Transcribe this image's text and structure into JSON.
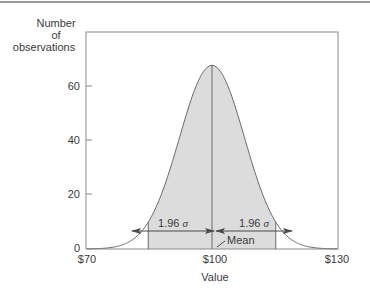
{
  "chart_data": {
    "type": "area",
    "title": "",
    "xlabel": "Value",
    "ylabel": "Number of observations",
    "ylabel_lines": [
      "Number",
      "of",
      "observations"
    ],
    "x_ticks": [
      "$70",
      "$100",
      "$130"
    ],
    "x_tick_values": [
      70,
      100,
      130
    ],
    "y_ticks": [
      "0",
      "20",
      "40",
      "60"
    ],
    "y_tick_values": [
      0,
      20,
      40,
      60
    ],
    "xlim": [
      70,
      130
    ],
    "ylim": [
      0,
      80
    ],
    "grid": false,
    "distribution": "normal",
    "mean": 100,
    "peak_observations": 68,
    "shaded_interval": [
      84.7,
      115.3
    ],
    "annotations": [
      {
        "text": "1.96 σ",
        "from": 84.7,
        "to": 100,
        "label_parts": [
          "1.96",
          "σ"
        ]
      },
      {
        "text": "1.96 σ",
        "from": 100,
        "to": 115.3,
        "label_parts": [
          "1.96",
          "σ"
        ]
      },
      {
        "text": "Mean",
        "x": 100
      }
    ],
    "x": [
      70,
      75,
      80,
      85,
      90,
      95,
      100,
      105,
      110,
      115,
      120,
      125,
      130
    ],
    "values": [
      0.3,
      1.5,
      5.6,
      15.3,
      30.2,
      50.3,
      68,
      50.3,
      30.2,
      15.3,
      5.6,
      1.5,
      0.3
    ]
  },
  "labels": {
    "ylabel_1": "Number",
    "ylabel_2": "of",
    "ylabel_3": "observations",
    "xlabel": "Value",
    "y60": "60",
    "y40": "40",
    "y20": "20",
    "y0": "0",
    "x70": "$70",
    "x100": "$100",
    "x130": "$130",
    "left_sigma_num": "1.96",
    "right_sigma_num": "1.96",
    "sigma": "σ",
    "mean": "Mean"
  },
  "colors": {
    "shade": "#dcdcdc",
    "line": "#6a6a6a",
    "axis": "#8a8a8a"
  }
}
